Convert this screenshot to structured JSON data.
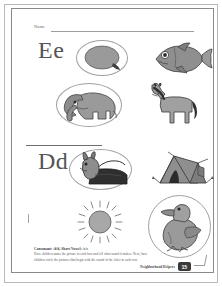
{
  "worksheet": {
    "name_label": "Name",
    "sections": [
      {
        "letter": "Ee",
        "items": [
          {
            "icon": "egg-illustration",
            "label": "egg",
            "circled": true
          },
          {
            "icon": "fish-illustration",
            "label": "fish",
            "circled": false
          },
          {
            "icon": "elephant-illustration",
            "label": "elephant",
            "circled": true
          },
          {
            "icon": "horse-illustration",
            "label": "horse",
            "circled": false
          }
        ]
      },
      {
        "letter": "Dd",
        "items": [
          {
            "icon": "dog-illustration",
            "label": "dog",
            "circled": true
          },
          {
            "icon": "tent-illustration",
            "label": "tent",
            "circled": false
          },
          {
            "icon": "sun-illustration",
            "label": "sun",
            "circled": false
          },
          {
            "icon": "duck-illustration",
            "label": "duck",
            "circled": true
          }
        ]
      }
    ],
    "footer": {
      "title": "Consonant: /d/d, Short Vowel: /e/e",
      "instruction_line_1": "Have children name the picture in each box and tell what sound it makes. Next, have",
      "instruction_line_2": "children circle the pictures that begin with the sound of the letter in each row."
    },
    "imprint": "Neighborhood Helpers",
    "page_number": "15",
    "colors": {
      "ink": "#555555",
      "rule": "#9d9d9d",
      "art_fill": "#9a9a9a",
      "badge": "#3a3a3a"
    }
  }
}
